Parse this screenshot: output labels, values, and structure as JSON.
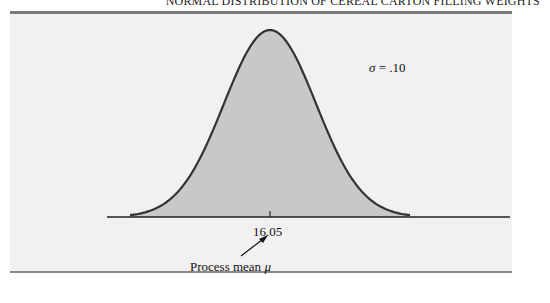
{
  "caption": "NORMAL DISTRIBUTION OF CEREAL CARTON FILLING WEIGHTS",
  "chart_data": {
    "type": "area",
    "title": "Normal distribution of cereal carton filling weights",
    "distribution": "normal",
    "mean": 16.05,
    "sigma": 0.1,
    "x_tick_labels": [
      "16.05"
    ],
    "annotations": [
      {
        "text": "σ = .10",
        "position": "upper right of curve"
      },
      {
        "text": "Process mean μ",
        "points_to": "16.05"
      }
    ],
    "fill_color": "#c8c8c8",
    "line_color": "#333333",
    "grid": false,
    "legend": "none"
  },
  "labels": {
    "sigma_symbol": "σ",
    "sigma_value": " = .10",
    "tick": "16.05",
    "mean_text": "Process mean ",
    "mean_symbol": "μ"
  }
}
